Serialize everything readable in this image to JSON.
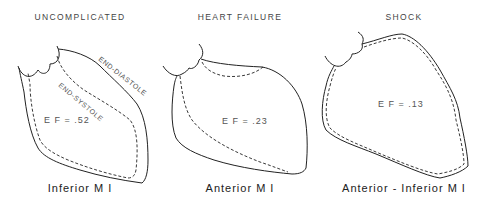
{
  "panels": [
    {
      "title": "UNCOMPLICATED",
      "ef_label": "E F = .52",
      "caption": "Inferior  M I",
      "outline_labels": {
        "diastole": "END-DIASTOLE",
        "systole": "END-SYSTOLE"
      }
    },
    {
      "title": "HEART FAILURE",
      "ef_label": "E F = .23",
      "caption": "Anterior  M I"
    },
    {
      "title": "SHOCK",
      "ef_label": "E F = .13",
      "caption": "Anterior - Inferior  M I"
    }
  ],
  "legend": {
    "solid_line": "end-diastole contour",
    "dashed_line": "end-systole contour"
  },
  "colors": {
    "line": "#222222",
    "text": "#444444",
    "background": "#ffffff"
  }
}
